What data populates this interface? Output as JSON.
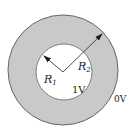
{
  "diagram": {
    "colors": {
      "annulus_fill": "#c9c9c9",
      "inner_fill": "#ffffff",
      "stroke": "#555555",
      "arrow": "#1a1a1a"
    },
    "labels": {
      "r1_main": "R",
      "r1_sub": "1",
      "r2_main": "R",
      "r2_sub": "2",
      "inner_potential": "1V",
      "outer_potential": "0V"
    }
  }
}
